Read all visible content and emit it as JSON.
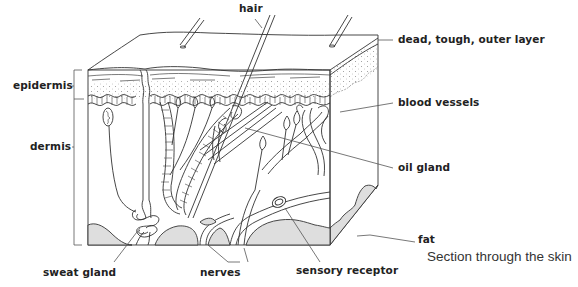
{
  "title": "Section through the skin",
  "labels": {
    "hair": "hair",
    "outer_layer": "dead, tough, outer layer",
    "epidermis": "epidermis",
    "blood_vessels": "blood vessels",
    "dermis": "dermis",
    "oil_gland": "oil gland",
    "fat": "fat",
    "sweat_gland": "sweat gland",
    "nerves": "nerves",
    "sensory_receptor": "sensory receptor"
  },
  "colors": {
    "line": "#333333",
    "fat_fill": "#dedede",
    "dots": "#888888",
    "text": "#222222"
  }
}
